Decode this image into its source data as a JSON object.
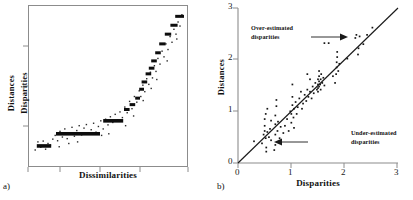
{
  "figure": {
    "panel_a": {
      "label": "a)",
      "xlabel": "Dissimilarities",
      "ylabel_top": "Distances",
      "ylabel_bottom": "Disparities",
      "x_ticks": [
        "",
        "",
        "",
        ""
      ],
      "y_ticks": [
        "",
        "",
        ""
      ]
    },
    "panel_b": {
      "label": "b)",
      "xlabel": "Disparities",
      "ylabel": "Distances",
      "x_ticks": [
        "0",
        "1",
        "2",
        "3"
      ],
      "y_ticks": [
        "0",
        "1",
        "2",
        "3"
      ],
      "annotation_over_line1": "Over-estimated",
      "annotation_over_line2": "disparities",
      "annotation_under_line1": "Under-estimated",
      "annotation_under_line2": "disparities"
    }
  },
  "colors": {
    "axis": "#8c8c8c",
    "axis_dark": "#3a3a3a",
    "ink": "#111111",
    "background": "#ffffff"
  },
  "chart_data": [
    {
      "type": "scatter",
      "title": "",
      "xlabel": "Dissimilarities",
      "ylabel": "Distances / Disparities",
      "xlim": [
        0,
        10
      ],
      "ylim": [
        0,
        10
      ],
      "grid": false,
      "legend": "none",
      "description": "Shepard diagram: scatter of distances against dissimilarities with a monotone (isotonic) step function of disparities overlaid as thick horizontal bars.",
      "step_function": {
        "note": "Each item is a horizontal plateau of the monotone regression: x from x0 to x1 at height y.",
        "segments": [
          {
            "x0": 0.55,
            "x1": 1.45,
            "y": 1.3
          },
          {
            "x0": 1.75,
            "x1": 4.5,
            "y": 2.05
          },
          {
            "x0": 4.7,
            "x1": 5.95,
            "y": 2.85
          },
          {
            "x0": 6.0,
            "x1": 6.35,
            "y": 3.55
          },
          {
            "x0": 6.35,
            "x1": 6.7,
            "y": 3.85
          },
          {
            "x0": 6.7,
            "x1": 7.0,
            "y": 4.25
          },
          {
            "x0": 6.95,
            "x1": 7.25,
            "y": 4.8
          },
          {
            "x0": 7.1,
            "x1": 7.45,
            "y": 5.25
          },
          {
            "x0": 7.35,
            "x1": 7.7,
            "y": 5.75
          },
          {
            "x0": 7.55,
            "x1": 7.9,
            "y": 6.1
          },
          {
            "x0": 7.7,
            "x1": 8.05,
            "y": 6.55
          },
          {
            "x0": 7.95,
            "x1": 8.3,
            "y": 7.05
          },
          {
            "x0": 8.2,
            "x1": 8.6,
            "y": 7.6
          },
          {
            "x0": 8.55,
            "x1": 8.95,
            "y": 8.2
          },
          {
            "x0": 8.9,
            "x1": 9.35,
            "y": 8.75
          },
          {
            "x0": 9.2,
            "x1": 9.75,
            "y": 9.3
          }
        ]
      },
      "points": [
        [
          0.45,
          1.05
        ],
        [
          0.62,
          1.55
        ],
        [
          0.8,
          1.22
        ],
        [
          0.95,
          1.6
        ],
        [
          1.1,
          1.1
        ],
        [
          1.25,
          1.45
        ],
        [
          1.4,
          1.35
        ],
        [
          1.55,
          1.72
        ],
        [
          1.7,
          1.95
        ],
        [
          1.85,
          1.62
        ],
        [
          2.0,
          2.2
        ],
        [
          2.15,
          1.85
        ],
        [
          2.3,
          2.35
        ],
        [
          2.45,
          1.75
        ],
        [
          2.6,
          2.1
        ],
        [
          2.75,
          2.45
        ],
        [
          2.9,
          1.9
        ],
        [
          3.05,
          2.25
        ],
        [
          3.2,
          2.55
        ],
        [
          3.35,
          1.98
        ],
        [
          3.5,
          2.4
        ],
        [
          3.65,
          2.62
        ],
        [
          3.8,
          2.08
        ],
        [
          3.95,
          2.3
        ],
        [
          4.1,
          2.7
        ],
        [
          4.25,
          2.15
        ],
        [
          4.4,
          2.5
        ],
        [
          4.55,
          2.85
        ],
        [
          4.7,
          2.35
        ],
        [
          4.85,
          2.95
        ],
        [
          5.0,
          2.6
        ],
        [
          5.15,
          3.1
        ],
        [
          5.3,
          2.75
        ],
        [
          5.45,
          3.25
        ],
        [
          5.6,
          2.9
        ],
        [
          5.75,
          3.4
        ],
        [
          5.9,
          3.05
        ],
        [
          6.05,
          3.7
        ],
        [
          6.2,
          3.35
        ],
        [
          6.35,
          4.05
        ],
        [
          6.5,
          3.6
        ],
        [
          6.65,
          4.35
        ],
        [
          6.8,
          4.0
        ],
        [
          6.95,
          4.7
        ],
        [
          7.05,
          4.35
        ],
        [
          7.18,
          5.05
        ],
        [
          7.3,
          4.65
        ],
        [
          7.42,
          5.45
        ],
        [
          7.55,
          5.1
        ],
        [
          7.65,
          5.85
        ],
        [
          7.78,
          5.5
        ],
        [
          7.9,
          6.25
        ],
        [
          8.0,
          5.9
        ],
        [
          8.12,
          6.7
        ],
        [
          8.25,
          6.35
        ],
        [
          8.38,
          7.15
        ],
        [
          8.5,
          6.8
        ],
        [
          8.62,
          7.6
        ],
        [
          8.75,
          7.25
        ],
        [
          8.88,
          8.05
        ],
        [
          9.0,
          7.7
        ],
        [
          9.12,
          8.5
        ],
        [
          9.25,
          8.2
        ],
        [
          9.38,
          8.95
        ],
        [
          9.5,
          8.7
        ],
        [
          9.62,
          9.4
        ],
        [
          6.1,
          2.55
        ],
        [
          5.05,
          2.05
        ],
        [
          3.1,
          1.55
        ],
        [
          1.95,
          1.25
        ],
        [
          4.6,
          1.95
        ],
        [
          7.2,
          4.1
        ],
        [
          8.05,
          5.4
        ],
        [
          8.7,
          6.55
        ],
        [
          9.3,
          7.9
        ],
        [
          2.55,
          1.45
        ],
        [
          6.6,
          3.15
        ],
        [
          7.7,
          4.85
        ]
      ]
    },
    {
      "type": "scatter",
      "title": "",
      "xlabel": "Disparities",
      "ylabel": "Distances",
      "xlim": [
        0,
        3
      ],
      "ylim": [
        0,
        3
      ],
      "grid": false,
      "legend": "none",
      "description": "Distances versus disparities with the y = x identity line; points above the line are over-estimated disparities, points below are under-estimated disparities.",
      "reference_line": {
        "type": "identity",
        "from": [
          0,
          0
        ],
        "to": [
          3,
          3
        ]
      },
      "annotations": [
        {
          "text": "Over-estimated disparities",
          "x": 1.05,
          "y": 2.55,
          "arrow_to": [
            1.62,
            2.32
          ]
        },
        {
          "text": "Under-estimated disparities",
          "x": 1.62,
          "y": 0.55,
          "arrow_to": [
            0.82,
            0.5
          ]
        }
      ],
      "points": [
        [
          0.3,
          0.42
        ],
        [
          0.45,
          0.38
        ],
        [
          0.48,
          0.55
        ],
        [
          0.5,
          0.62
        ],
        [
          0.5,
          0.72
        ],
        [
          0.5,
          0.85
        ],
        [
          0.52,
          0.95
        ],
        [
          0.52,
          0.48
        ],
        [
          0.53,
          0.3
        ],
        [
          0.53,
          0.22
        ],
        [
          0.55,
          0.6
        ],
        [
          0.55,
          1.05
        ],
        [
          0.58,
          0.5
        ],
        [
          0.6,
          0.66
        ],
        [
          0.62,
          0.44
        ],
        [
          0.68,
          0.25
        ],
        [
          0.7,
          0.35
        ],
        [
          0.7,
          0.55
        ],
        [
          0.7,
          0.75
        ],
        [
          0.7,
          0.92
        ],
        [
          0.72,
          1.1
        ],
        [
          0.72,
          1.22
        ],
        [
          0.74,
          0.62
        ],
        [
          0.75,
          0.8
        ],
        [
          0.78,
          0.48
        ],
        [
          0.8,
          0.7
        ],
        [
          0.88,
          0.72
        ],
        [
          0.92,
          0.85
        ],
        [
          0.95,
          0.62
        ],
        [
          0.98,
          1.0
        ],
        [
          1.0,
          0.78
        ],
        [
          1.0,
          0.95
        ],
        [
          1.02,
          1.12
        ],
        [
          1.02,
          1.28
        ],
        [
          1.02,
          1.52
        ],
        [
          1.04,
          0.88
        ],
        [
          1.05,
          1.05
        ],
        [
          1.05,
          0.68
        ],
        [
          1.08,
          1.18
        ],
        [
          1.1,
          0.95
        ],
        [
          1.12,
          1.08
        ],
        [
          1.15,
          1.25
        ],
        [
          1.2,
          1.05
        ],
        [
          1.22,
          1.15
        ],
        [
          1.25,
          1.32
        ],
        [
          1.28,
          1.2
        ],
        [
          1.3,
          1.42
        ],
        [
          1.3,
          1.72
        ],
        [
          1.32,
          1.28
        ],
        [
          1.35,
          1.38
        ],
        [
          1.38,
          1.25
        ],
        [
          1.4,
          1.48
        ],
        [
          1.42,
          1.35
        ],
        [
          1.45,
          1.55
        ],
        [
          1.48,
          1.42
        ],
        [
          1.5,
          1.52
        ],
        [
          1.5,
          1.62
        ],
        [
          1.5,
          1.45
        ],
        [
          1.5,
          1.38
        ],
        [
          1.52,
          1.58
        ],
        [
          1.52,
          1.48
        ],
        [
          1.52,
          1.68
        ],
        [
          1.52,
          1.78
        ],
        [
          1.54,
          1.52
        ],
        [
          1.55,
          1.62
        ],
        [
          1.55,
          1.42
        ],
        [
          1.56,
          1.72
        ],
        [
          1.58,
          1.55
        ],
        [
          1.6,
          1.65
        ],
        [
          1.62,
          1.5
        ],
        [
          1.62,
          2.32
        ],
        [
          1.7,
          2.32
        ],
        [
          1.82,
          1.55
        ],
        [
          1.84,
          1.72
        ],
        [
          1.85,
          1.85
        ],
        [
          1.85,
          1.95
        ],
        [
          1.86,
          2.05
        ],
        [
          1.86,
          2.15
        ],
        [
          1.88,
          1.78
        ],
        [
          1.9,
          1.92
        ],
        [
          2.2,
          2.42
        ],
        [
          2.22,
          2.48
        ],
        [
          2.25,
          2.1
        ],
        [
          2.26,
          2.22
        ],
        [
          2.28,
          2.45
        ],
        [
          2.42,
          2.48
        ],
        [
          2.52,
          2.62
        ],
        [
          0.62,
          0.82
        ],
        [
          0.85,
          0.58
        ],
        [
          1.18,
          1.38
        ],
        [
          1.35,
          1.62
        ],
        [
          1.78,
          1.68
        ],
        [
          2.05,
          2.02
        ],
        [
          2.35,
          2.3
        ]
      ]
    }
  ]
}
